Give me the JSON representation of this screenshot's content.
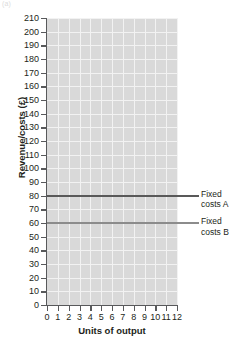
{
  "header": {
    "figure_label": "(a)",
    "cut_text": ""
  },
  "chart_data": {
    "type": "line",
    "title": "",
    "subtitle": "",
    "xlabel": "Units of output",
    "ylabel": "Revenue/costs (£)",
    "xlim": [
      0,
      12
    ],
    "ylim": [
      0,
      210
    ],
    "xticks": [
      0,
      1,
      2,
      3,
      4,
      5,
      6,
      7,
      8,
      9,
      10,
      11,
      12
    ],
    "yticks": [
      0,
      10,
      20,
      30,
      40,
      50,
      60,
      70,
      80,
      90,
      100,
      110,
      120,
      130,
      140,
      150,
      160,
      170,
      180,
      190,
      200,
      210
    ],
    "grid": true,
    "grid_color": "#f2f2f2",
    "plot_background": "#d9d9d9",
    "legend_position": "right-callout",
    "x": [
      0,
      1,
      2,
      3,
      4,
      5,
      6,
      7,
      8,
      9,
      10,
      11,
      12
    ],
    "series": [
      {
        "name": "Fixed costs A",
        "label_line1": "Fixed",
        "label_line2": "costs A",
        "color": "#595959",
        "constant_value": 80,
        "values": [
          80,
          80,
          80,
          80,
          80,
          80,
          80,
          80,
          80,
          80,
          80,
          80,
          80
        ]
      },
      {
        "name": "Fixed costs B",
        "label_line1": "Fixed",
        "label_line2": "costs B",
        "color": "#8c8c8c",
        "constant_value": 60,
        "values": [
          60,
          60,
          60,
          60,
          60,
          60,
          60,
          60,
          60,
          60,
          60,
          60,
          60
        ]
      }
    ]
  }
}
